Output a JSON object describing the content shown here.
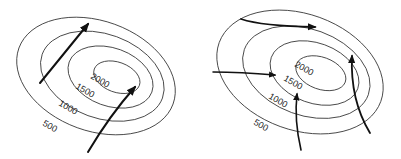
{
  "figure": {
    "panels": [
      {
        "id": "left",
        "contour_labels": [
          "2000",
          "1500",
          "1000",
          "500"
        ],
        "arrows": 2
      },
      {
        "id": "right",
        "contour_labels": [
          "2000",
          "1500",
          "1000",
          "500"
        ],
        "arrows": 4
      }
    ]
  },
  "left": {
    "label_2000": "2000",
    "label_1500": "1500",
    "label_1000": "1000",
    "label_500": "500"
  },
  "right": {
    "label_2000": "2000",
    "label_1500": "1500",
    "label_1000": "1000",
    "label_500": "500"
  },
  "colors": {
    "line": "#333333",
    "arrow": "#111111",
    "background": "#ffffff"
  }
}
